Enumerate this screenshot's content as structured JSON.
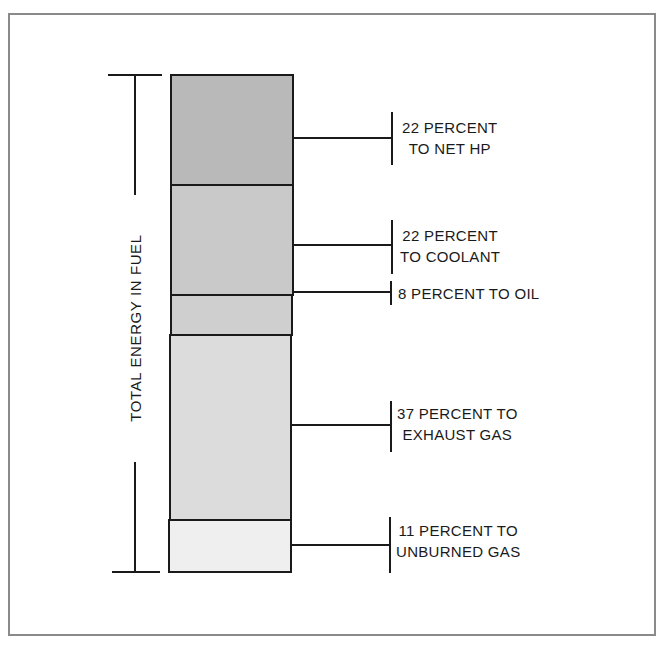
{
  "diagram": {
    "axis_label": "TOTAL ENERGY IN FUEL",
    "segments": [
      {
        "id": "net-hp",
        "percent": 22,
        "line1": "22 PERCENT",
        "line2": "TO NET HP",
        "fill": "#b9b9b9"
      },
      {
        "id": "coolant",
        "percent": 22,
        "line1": "22 PERCENT",
        "line2": "TO COOLANT",
        "fill": "#c9c9c9"
      },
      {
        "id": "oil",
        "percent": 8,
        "line1": "8 PERCENT TO OIL",
        "line2": "",
        "fill": "#cfcfcf"
      },
      {
        "id": "exhaust",
        "percent": 37,
        "line1": "37 PERCENT TO",
        "line2": "EXHAUST GAS",
        "fill": "#dcdcdc"
      },
      {
        "id": "unburned",
        "percent": 11,
        "line1": "11 PERCENT TO",
        "line2": "UNBURNED GAS",
        "fill": "#efefef"
      }
    ]
  },
  "colors": {
    "frame": "#8a8a8a",
    "ink": "#1a1a1a"
  }
}
